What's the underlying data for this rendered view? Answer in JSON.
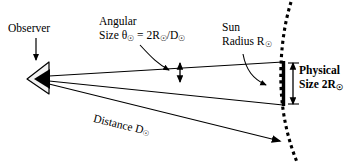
{
  "diagram": {
    "background_color": "#ffffff",
    "stroke_color": "#000000",
    "width": 360,
    "height": 164
  },
  "labels": {
    "observer": "Observer",
    "angular_size_line1": "Angular",
    "angular_size_line2_prefix": "Size ",
    "angular_size_theta": "θ",
    "angular_size_eq": " = 2R",
    "angular_size_slash": "/D",
    "sun_line1": "Sun",
    "sun_line2": "Radius R",
    "physical_line1": "Physical",
    "physical_line2": "Size 2R",
    "distance": "Distance D",
    "sun_symbol": "☉"
  },
  "elements": {
    "observer_eye": "observer-eye-triangle",
    "observer_pointer": "observer-arrow",
    "sun_bar": "sun-diameter-bar",
    "sun_arc": "dotted-sphere-arc",
    "ray_upper": "sight-ray-upper",
    "ray_middle": "sight-ray-middle",
    "ray_lower": "sight-ray-lower",
    "angular_measure": "angular-size-double-arrow",
    "physical_measure": "physical-size-double-arrow",
    "leader_angular": "angular-size-leader-curve",
    "leader_sun": "sun-radius-leader-curve",
    "distance_arrow": "distance-arrow"
  }
}
